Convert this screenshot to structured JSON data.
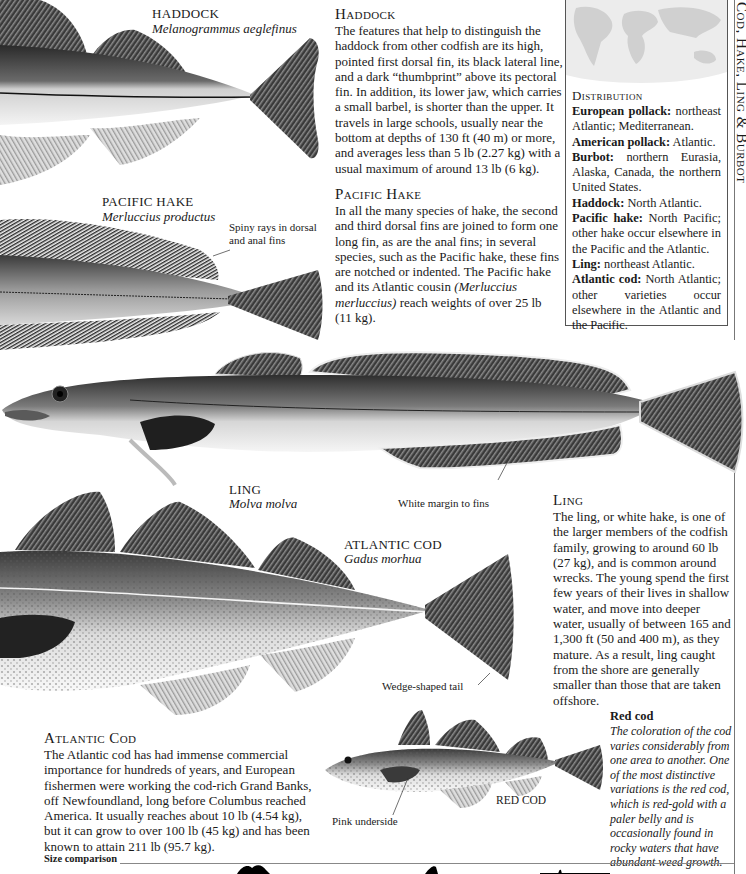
{
  "spine": {
    "title": "Cod, Hake, Ling & Burbot"
  },
  "haddock": {
    "common_name": "HADDOCK",
    "latin_name": "Melanogrammus aeglefinus",
    "heading": "Haddock",
    "body": "The features that help to distinguish the haddock from other codfish are its high, pointed first dorsal fin, its black lateral line, and a dark “thumbprint” above its pectoral fin. In addition, its lower jaw, which carries a small barbel, is shorter than the upper. It travels in large schools, usually near the bottom at depths of 130 ft (40 m) or more, and averages less than 5 lb (2.27 kg) with a usual maximum of around 13 lb (6 kg)."
  },
  "pacific_hake": {
    "common_name": "PACIFIC HAKE",
    "latin_name": "Merluccius productus",
    "callout": "Spiny rays in dorsal and anal fins",
    "heading": "Pacific Hake",
    "body_before": "In all the many species of hake, the second and third dorsal fins are joined to form one long fin, as are the anal fins; in several species, such as the Pacific hake, these fins are notched or indented. The Pacific hake and its Atlantic cousin ",
    "body_italic": "(Merluccius merluccius)",
    "body_after": " reach weights of over 25 lb (11 kg)."
  },
  "distribution": {
    "heading": "Distribution",
    "map_icon": "world-map",
    "map_color": "#dcdcdc",
    "entries": [
      {
        "name": "European pollack:",
        "range": " northeast Atlantic; Mediterranean."
      },
      {
        "name": "American pollack:",
        "range": " Atlantic."
      },
      {
        "name": "Burbot:",
        "range": " northern Eurasia, Alaska, Canada, the northern United States."
      },
      {
        "name": "Haddock:",
        "range": " North Atlantic."
      },
      {
        "name": "Pacific hake:",
        "range": " North Pacific; other hake occur elsewhere in the Pacific and the Atlantic."
      },
      {
        "name": "Ling:",
        "range": " northeast Atlantic."
      },
      {
        "name": "Atlantic cod:",
        "range": " North Atlantic; other varieties occur elsewhere in the Atlantic and the Pacific."
      }
    ]
  },
  "ling": {
    "common_name": "LING",
    "latin_name": "Molva molva",
    "callout": "White margin to fins",
    "heading": "Ling",
    "body": "The ling, or white hake, is one of the larger members of the codfish family, growing to around 60 lb (27 kg), and is common around wrecks. The young spend the first few years of their lives in shallow water, and move into deeper water, usually of between 165 and 1,300 ft (50 and 400 m), as they mature. As a result, ling caught from the shore are generally smaller than those that are taken offshore."
  },
  "atlantic_cod": {
    "common_name": "ATLANTIC COD",
    "latin_name": "Gadus morhua",
    "callout": "Wedge-shaped tail",
    "heading": "Atlantic Cod",
    "body": "The Atlantic cod has had immense commercial importance for hundreds of years, and European fishermen were working the cod-rich Grand Banks, off Newfoundland, long before Columbus reached America. It usually reaches about 10 lb (4.54 kg), but it can grow to over 100 lb (45 kg) and has been known to attain 211 lb (95.7 kg)."
  },
  "red_cod": {
    "common_name": "RED COD",
    "callout": "Pink underside",
    "note_heading": "Red cod",
    "note_body": "The coloration of the cod varies considerably from one area to another. One of the most distinctive variations is the red cod, which is red-gold with a paler belly and is occasionally found in rocky waters that have abundant weed growth."
  },
  "size_comparison": {
    "label": "Size comparison"
  }
}
